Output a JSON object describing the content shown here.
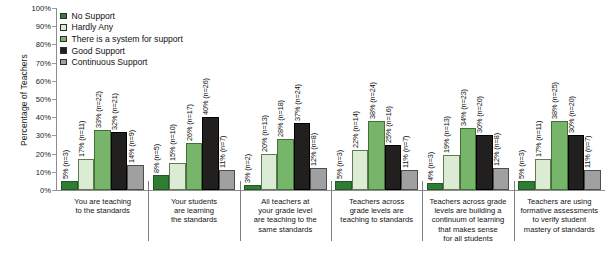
{
  "chart_data": {
    "type": "bar",
    "title": "",
    "xlabel": "",
    "ylabel": "Percentage of Teachers",
    "ylim": [
      0,
      100
    ],
    "ytick_labels": [
      "100%",
      "90%",
      "80%",
      "70%",
      "60%",
      "50%",
      "40%",
      "30%",
      "20%",
      "10%",
      "0%"
    ],
    "grid": false,
    "legend_position": "top-left",
    "categories": [
      "You are teaching\nto the standards",
      "Your students\nare learning\nthe standards",
      "All teachers at\nyour grade level\nare teaching to the\nsame standards",
      "Teachers across\ngrade levels are\nteaching to standards",
      "Teachers across grade\nlevels are building a\ncontinuum of learning\nthat makes sense\nfor all students",
      "Teachers are using\nformative assessments\nto verify student\nmastery of standards"
    ],
    "series": [
      {
        "name": "No Support",
        "color": "#2f7d32",
        "values": [
          5,
          8,
          3,
          5,
          4,
          5
        ],
        "counts": [
          3,
          5,
          2,
          3,
          3,
          3
        ],
        "labels": [
          "5% (n=3)",
          "8% (n=5)",
          "3% (n=2)",
          "5% (n=3)",
          "4% (n=3)",
          "5% (n=3)"
        ]
      },
      {
        "name": "Hardly Any",
        "color": "#dcecd4",
        "values": [
          17,
          15,
          20,
          22,
          19,
          17
        ],
        "counts": [
          11,
          10,
          13,
          14,
          13,
          11
        ],
        "labels": [
          "17% (n=11)",
          "15% (n=10)",
          "20% (n=13)",
          "22% (n=14)",
          "19% (n=13)",
          "17% (n=11)"
        ]
      },
      {
        "name": "There is a system for support",
        "color": "#77b56b",
        "values": [
          33,
          26,
          28,
          38,
          34,
          38
        ],
        "counts": [
          22,
          17,
          18,
          24,
          23,
          25
        ],
        "labels": [
          "33% (n=22)",
          "26% (n=17)",
          "28% (n=18)",
          "38% (n=24)",
          "34% (n=23)",
          "38% (n=25)"
        ]
      },
      {
        "name": "Good Support",
        "color": "#221f1f",
        "values": [
          32,
          40,
          37,
          25,
          30,
          30
        ],
        "counts": [
          21,
          26,
          24,
          16,
          20,
          20
        ],
        "labels": [
          "32% (n=21)",
          "40% (n=26)",
          "37% (n=24)",
          "25% (n=16)",
          "30% (n=20)",
          "30% (n=20)"
        ]
      },
      {
        "name": "Continuous Support",
        "color": "#a0a0a0",
        "values": [
          14,
          11,
          12,
          11,
          12,
          11
        ],
        "counts": [
          9,
          7,
          8,
          7,
          8,
          7
        ],
        "labels": [
          "14% (n=9)",
          "11% (n=7)",
          "12% (n=8)",
          "11% (n=7)",
          "12% (n=8)",
          "11% (n=7)"
        ]
      }
    ]
  }
}
